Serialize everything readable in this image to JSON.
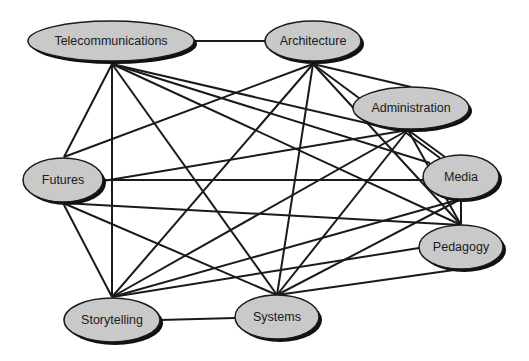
{
  "diagram": {
    "type": "network",
    "title": "",
    "colors": {
      "node_fill": "#c9c9c9",
      "node_stroke": "#1a1a1a",
      "edge": "#1a1a1a",
      "background": "#ffffff"
    },
    "nodes": [
      {
        "id": "telecommunications",
        "label": "Telecommunications",
        "cx": 111,
        "cy": 41,
        "rx": 83,
        "ry": 20
      },
      {
        "id": "architecture",
        "label": "Architecture",
        "cx": 313,
        "cy": 41,
        "rx": 48,
        "ry": 20
      },
      {
        "id": "administration",
        "label": "Administration",
        "cx": 411,
        "cy": 108,
        "rx": 58,
        "ry": 21
      },
      {
        "id": "futures",
        "label": "Futures",
        "cx": 63,
        "cy": 180,
        "rx": 40,
        "ry": 22
      },
      {
        "id": "media",
        "label": "Media",
        "cx": 461,
        "cy": 177,
        "rx": 38,
        "ry": 22
      },
      {
        "id": "pedagogy",
        "label": "Pedagogy",
        "cx": 461,
        "cy": 247,
        "rx": 42,
        "ry": 22
      },
      {
        "id": "storytelling",
        "label": "Storytelling",
        "cx": 112,
        "cy": 320,
        "rx": 48,
        "ry": 22
      },
      {
        "id": "systems",
        "label": "Systems",
        "cx": 277,
        "cy": 317,
        "rx": 42,
        "ry": 22
      }
    ],
    "edges": [
      {
        "from": "telecommunications",
        "to": "architecture",
        "x1": 194,
        "y1": 41,
        "x2": 265,
        "y2": 41
      },
      {
        "from": "telecommunications",
        "to": "futures",
        "x1": 112,
        "y1": 64,
        "x2": 64,
        "y2": 157
      },
      {
        "from": "telecommunications",
        "to": "storytelling",
        "x1": 112,
        "y1": 64,
        "x2": 112,
        "y2": 297
      },
      {
        "from": "telecommunications",
        "to": "systems",
        "x1": 112,
        "y1": 64,
        "x2": 277,
        "y2": 295
      },
      {
        "from": "telecommunications",
        "to": "administration",
        "x1": 112,
        "y1": 64,
        "x2": 375,
        "y2": 125
      },
      {
        "from": "telecommunications",
        "to": "media",
        "x1": 112,
        "y1": 64,
        "x2": 430,
        "y2": 163
      },
      {
        "from": "telecommunications",
        "to": "pedagogy",
        "x1": 112,
        "y1": 64,
        "x2": 461,
        "y2": 225
      },
      {
        "from": "architecture",
        "to": "administration",
        "x1": 313,
        "y1": 64,
        "x2": 411,
        "y2": 87
      },
      {
        "from": "architecture",
        "to": "futures",
        "x1": 313,
        "y1": 64,
        "x2": 64,
        "y2": 157
      },
      {
        "from": "architecture",
        "to": "storytelling",
        "x1": 313,
        "y1": 64,
        "x2": 112,
        "y2": 297
      },
      {
        "from": "architecture",
        "to": "systems",
        "x1": 313,
        "y1": 64,
        "x2": 277,
        "y2": 295
      },
      {
        "from": "architecture",
        "to": "media",
        "x1": 313,
        "y1": 64,
        "x2": 440,
        "y2": 158
      },
      {
        "from": "architecture",
        "to": "pedagogy",
        "x1": 313,
        "y1": 64,
        "x2": 461,
        "y2": 225
      },
      {
        "from": "administration",
        "to": "futures",
        "x1": 408,
        "y1": 130,
        "x2": 103,
        "y2": 181
      },
      {
        "from": "administration",
        "to": "storytelling",
        "x1": 408,
        "y1": 130,
        "x2": 112,
        "y2": 297
      },
      {
        "from": "administration",
        "to": "systems",
        "x1": 408,
        "y1": 130,
        "x2": 277,
        "y2": 295
      },
      {
        "from": "administration",
        "to": "media",
        "x1": 408,
        "y1": 130,
        "x2": 445,
        "y2": 157
      },
      {
        "from": "administration",
        "to": "pedagogy",
        "x1": 408,
        "y1": 130,
        "x2": 461,
        "y2": 225
      },
      {
        "from": "futures",
        "to": "media",
        "x1": 103,
        "y1": 180,
        "x2": 423,
        "y2": 180
      },
      {
        "from": "futures",
        "to": "pedagogy",
        "x1": 63,
        "y1": 203,
        "x2": 461,
        "y2": 225
      },
      {
        "from": "futures",
        "to": "storytelling",
        "x1": 63,
        "y1": 203,
        "x2": 112,
        "y2": 297
      },
      {
        "from": "futures",
        "to": "systems",
        "x1": 63,
        "y1": 203,
        "x2": 277,
        "y2": 295
      },
      {
        "from": "media",
        "to": "pedagogy",
        "x1": 461,
        "y1": 199,
        "x2": 461,
        "y2": 225
      },
      {
        "from": "media",
        "to": "storytelling",
        "x1": 461,
        "y1": 199,
        "x2": 112,
        "y2": 297
      },
      {
        "from": "media",
        "to": "systems",
        "x1": 461,
        "y1": 199,
        "x2": 277,
        "y2": 295
      },
      {
        "from": "pedagogy",
        "to": "storytelling",
        "x1": 419,
        "y1": 248,
        "x2": 112,
        "y2": 297
      },
      {
        "from": "pedagogy",
        "to": "systems",
        "x1": 461,
        "y1": 269,
        "x2": 277,
        "y2": 295
      },
      {
        "from": "storytelling",
        "to": "systems",
        "x1": 160,
        "y1": 320,
        "x2": 235,
        "y2": 318
      }
    ]
  }
}
